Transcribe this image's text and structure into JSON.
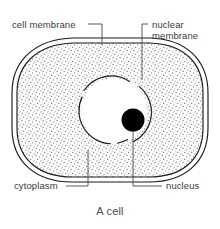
{
  "figure": {
    "caption": "A cell",
    "title": "A cell",
    "background_color": "#ffffff",
    "line_color": "#1a1a1a",
    "text_color": "#3a3a3a",
    "stipple_color": "#6e6e6e",
    "nucleolus_color": "#000000"
  },
  "labels": {
    "cell_membrane": "cell membrane",
    "nuclear_membrane_line1": "nuclear",
    "nuclear_membrane_line2": "membrane",
    "cytoplasm": "cytoplasm",
    "nucleus": "nucleus"
  },
  "diagram_data": {
    "type": "labelled-biology-diagram",
    "subject": "animal cell cross-section",
    "parts": [
      {
        "name": "cell membrane",
        "shape": "double rounded-rectangle outline",
        "bounds": {
          "x": 12,
          "y": 38,
          "width": 196,
          "height": 144
        },
        "label_position": "top-left",
        "leader": "horizontal then down to outer outline"
      },
      {
        "name": "cytoplasm",
        "shape": "stippled fill between membrane and nucleus",
        "label_position": "bottom-left",
        "leader": "horizontal then up into stippled region"
      },
      {
        "name": "nuclear membrane",
        "shape": "circle outline with breaks",
        "center": {
          "x": 114,
          "y": 111
        },
        "radius": 33,
        "label_position": "top-right",
        "leader": "horizontal then down to circle edge"
      },
      {
        "name": "nucleus",
        "shape": "filled black disc",
        "center": {
          "x": 133,
          "y": 120
        },
        "radius": 11,
        "label_position": "bottom-right",
        "leader": "horizontal then up to disc"
      }
    ]
  }
}
